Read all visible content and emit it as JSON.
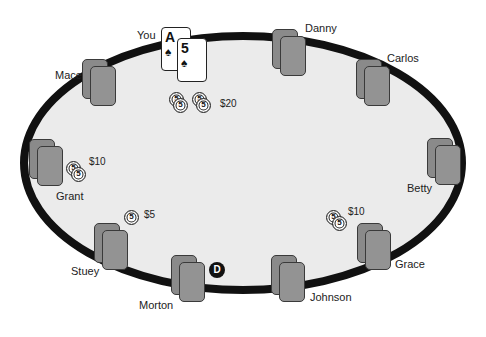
{
  "table": {
    "felt_color": "#ebebeb",
    "rail_color": "#111111"
  },
  "hero": {
    "name": "You",
    "cards": [
      {
        "rank": "A",
        "suit": "♠"
      },
      {
        "rank": "5",
        "suit": "♠"
      }
    ]
  },
  "players": [
    {
      "name": "Danny"
    },
    {
      "name": "Carlos"
    },
    {
      "name": "Betty"
    },
    {
      "name": "Grace"
    },
    {
      "name": "Johnson"
    },
    {
      "name": "Morton"
    },
    {
      "name": "Stuey"
    },
    {
      "name": "Grant"
    },
    {
      "name": "Mace"
    }
  ],
  "bets": {
    "hero": {
      "amount": "$20",
      "chip_label": "5"
    },
    "grant": {
      "amount": "$10",
      "chip_label": "5"
    },
    "stuey": {
      "amount": "$5",
      "chip_label": "5"
    },
    "grace": {
      "amount": "$10",
      "chip_label": "5"
    }
  },
  "dealer_button": {
    "label": "D"
  }
}
